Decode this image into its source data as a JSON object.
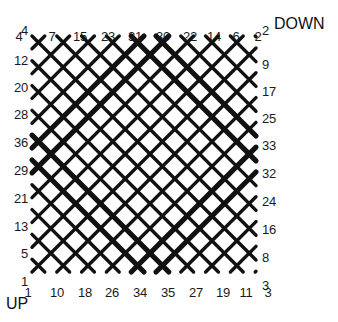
{
  "diagram": {
    "kind": "braid-lattice-diagram",
    "stroke_color": "#111111",
    "background_color": "#ffffff",
    "grid": {
      "left": 32,
      "top": 36,
      "right": 256,
      "bottom": 272,
      "step": 24.8
    },
    "corner_labels": {
      "down": "DOWN",
      "up": "UP"
    },
    "edges": {
      "top": {
        "name": "top-endpoints",
        "labels": [
          "4",
          "7",
          "15",
          "23",
          "31",
          "30",
          "22",
          "14",
          "6",
          "2"
        ],
        "x": [
          19,
          52,
          80,
          108,
          135,
          163,
          190,
          214,
          236,
          258
        ],
        "y": 30
      },
      "left": {
        "name": "left-endpoints",
        "labels": [
          "4",
          "12",
          "20",
          "28",
          "36",
          "29",
          "21",
          "13",
          "5",
          "1"
        ],
        "x": 28,
        "y": [
          30,
          60,
          87,
          114,
          142,
          170,
          198,
          226,
          253,
          281
        ]
      },
      "right": {
        "name": "right-endpoints",
        "labels": [
          "2",
          "9",
          "17",
          "25",
          "33",
          "32",
          "24",
          "16",
          "8",
          "3"
        ],
        "x": 262,
        "y": [
          30,
          64,
          91,
          118,
          145,
          173,
          201,
          229,
          257,
          285
        ]
      },
      "bottom": {
        "name": "bottom-endpoints",
        "labels": [
          "1",
          "10",
          "18",
          "26",
          "34",
          "35",
          "27",
          "19",
          "11",
          "3"
        ],
        "x": [
          28,
          57,
          85,
          112,
          140,
          168,
          196,
          223,
          246,
          268
        ],
        "y": 286
      }
    },
    "thick_strands": [
      {
        "name": "thick-strand-a",
        "from": "31",
        "to": "34"
      },
      {
        "name": "thick-strand-b",
        "from": "30",
        "to": "35"
      },
      {
        "name": "thick-strand-c",
        "from": "36",
        "to": "33"
      },
      {
        "name": "thick-strand-d",
        "from": "29",
        "to": "32"
      }
    ],
    "line_counts": {
      "down_right_strands": 10,
      "up_right_strands": 10
    }
  }
}
